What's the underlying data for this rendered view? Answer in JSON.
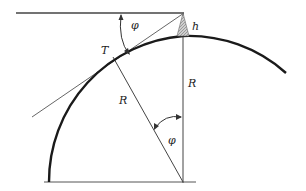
{
  "diagram": {
    "labels": {
      "phi_top": "φ",
      "h": "h",
      "T": "T",
      "R_vertical": "R",
      "R_radius": "R",
      "phi_center": "φ"
    },
    "colors": {
      "line": "#333333",
      "arc": "#1a1a1a",
      "tower_fill": "#b8b8b8",
      "background": "#ffffff"
    },
    "geometry": {
      "center": [
        183,
        182
      ],
      "radius": 146,
      "tower_top": [
        183,
        13
      ],
      "tangent_point": [
        113,
        57
      ]
    }
  }
}
